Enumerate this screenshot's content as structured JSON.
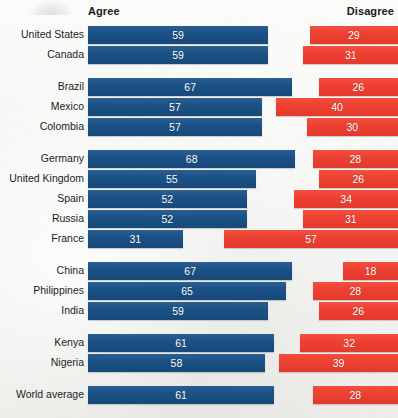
{
  "header": {
    "agree_label": "Agree",
    "disagree_label": "Disagree"
  },
  "colors": {
    "agree": "#1b5286",
    "disagree": "#ed4032",
    "background": "#f4f4f2",
    "text": "#1d1d1d"
  },
  "chart_data": {
    "type": "bar",
    "orientation": "horizontal",
    "layout": "diverging-paired",
    "title": "",
    "subtitle": "",
    "xlabel": "",
    "ylabel": "",
    "xlim": [
      0,
      100
    ],
    "grid": false,
    "legend_position": "top",
    "legend": [
      "Agree",
      "Disagree"
    ],
    "categories": [
      "United States",
      "Canada",
      "Brazil",
      "Mexico",
      "Colombia",
      "Germany",
      "United Kingdom",
      "Spain",
      "Russia",
      "France",
      "China",
      "Philippines",
      "India",
      "Kenya",
      "Nigeria",
      "World average"
    ],
    "series": [
      {
        "name": "Agree",
        "color": "#1b5286",
        "values": [
          59,
          59,
          67,
          57,
          57,
          68,
          55,
          52,
          52,
          31,
          67,
          65,
          59,
          61,
          58,
          61
        ]
      },
      {
        "name": "Disagree",
        "color": "#ed4032",
        "values": [
          29,
          31,
          26,
          40,
          30,
          28,
          26,
          34,
          31,
          57,
          18,
          28,
          26,
          32,
          39,
          28
        ]
      }
    ],
    "groups": [
      {
        "name": "North America",
        "rows": [
          0,
          1
        ]
      },
      {
        "name": "Latin America",
        "rows": [
          2,
          3,
          4
        ]
      },
      {
        "name": "Europe",
        "rows": [
          5,
          6,
          7,
          8,
          9
        ]
      },
      {
        "name": "Asia",
        "rows": [
          10,
          11,
          12
        ]
      },
      {
        "name": "Africa",
        "rows": [
          13,
          14
        ]
      },
      {
        "name": "Average",
        "rows": [
          15
        ]
      }
    ]
  },
  "rows": [
    {
      "label": "United States",
      "agree": 59,
      "disagree": 29,
      "y": 26
    },
    {
      "label": "Canada",
      "agree": 59,
      "disagree": 31,
      "y": 46
    },
    {
      "label": "Brazil",
      "agree": 67,
      "disagree": 26,
      "y": 78
    },
    {
      "label": "Mexico",
      "agree": 57,
      "disagree": 40,
      "y": 98
    },
    {
      "label": "Colombia",
      "agree": 57,
      "disagree": 30,
      "y": 118
    },
    {
      "label": "Germany",
      "agree": 68,
      "disagree": 28,
      "y": 150
    },
    {
      "label": "United Kingdom",
      "agree": 55,
      "disagree": 26,
      "y": 170
    },
    {
      "label": "Spain",
      "agree": 52,
      "disagree": 34,
      "y": 190
    },
    {
      "label": "Russia",
      "agree": 52,
      "disagree": 31,
      "y": 210
    },
    {
      "label": "France",
      "agree": 31,
      "disagree": 57,
      "y": 230
    },
    {
      "label": "China",
      "agree": 67,
      "disagree": 18,
      "y": 262
    },
    {
      "label": "Philippines",
      "agree": 65,
      "disagree": 28,
      "y": 282
    },
    {
      "label": "India",
      "agree": 59,
      "disagree": 26,
      "y": 302
    },
    {
      "label": "Kenya",
      "agree": 61,
      "disagree": 32,
      "y": 334
    },
    {
      "label": "Nigeria",
      "agree": 58,
      "disagree": 39,
      "y": 354
    },
    {
      "label": "World average",
      "agree": 61,
      "disagree": 28,
      "y": 386
    }
  ],
  "scale": {
    "agree_origin_x": 88,
    "disagree_origin_x": 398,
    "px_per_unit": 3.05
  }
}
